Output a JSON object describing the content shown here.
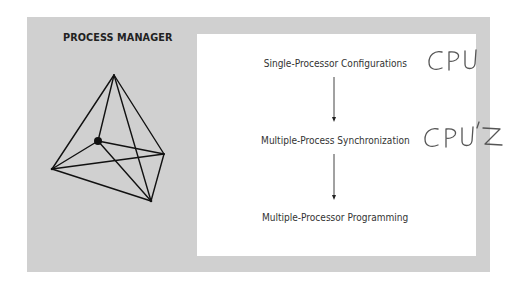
{
  "diagram": {
    "title": "PROCESS MANAGER",
    "steps": [
      {
        "label": "Single-Processor Configurations",
        "annotation": "CPU"
      },
      {
        "label": "Multiple-Process Synchronization",
        "annotation": "CPU'S"
      },
      {
        "label": "Multiple-Processor Programming",
        "annotation": ""
      }
    ],
    "arrows": [
      {
        "from": "Single-Processor Configurations",
        "to": "Multiple-Process Synchronization"
      },
      {
        "from": "Multiple-Process Synchronization",
        "to": "Multiple-Processor Programming"
      }
    ],
    "illustration": {
      "type": "tetrahedron-wireframe",
      "vertices": {
        "top": [
          114,
          75
        ],
        "center": [
          98,
          141
        ],
        "right": [
          164,
          154
        ],
        "left": [
          52,
          169
        ],
        "bottom": [
          151,
          201
        ]
      },
      "highlighted_vertex": "center"
    },
    "colors": {
      "panel_gray": "#d0d0d0",
      "inner_white": "#ffffff",
      "text_dark": "#222222",
      "handwriting": "#555555"
    }
  }
}
